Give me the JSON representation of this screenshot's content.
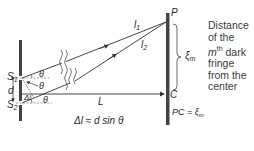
{
  "labels": {
    "S1": "S",
    "S1_sub": "1",
    "S2": "S",
    "S2_sub": "2",
    "d": "d",
    "theta": "θ",
    "delta_l": "Δl",
    "L": "L",
    "P": "P",
    "C": "C",
    "l1": "l",
    "l1_sub": "1",
    "l2": "l",
    "l2_sub": "2",
    "xi_m": "ξ",
    "xi_m_sub": "m",
    "path_difference": "Δl ≈ d sin θ",
    "pc_eq_prefix": "PC = ",
    "pc_eq_xi": "ξ",
    "pc_eq_sub": "m"
  },
  "description": {
    "line1": "Distance",
    "line2": "of the",
    "line3_m": "m",
    "line3_sup": "th",
    "line3_rest": " dark",
    "line4": "fringe",
    "line5": "from the",
    "line6": "center"
  },
  "colors": {
    "line": "#333333",
    "barrier": "#444444",
    "dashed": "#666666"
  }
}
